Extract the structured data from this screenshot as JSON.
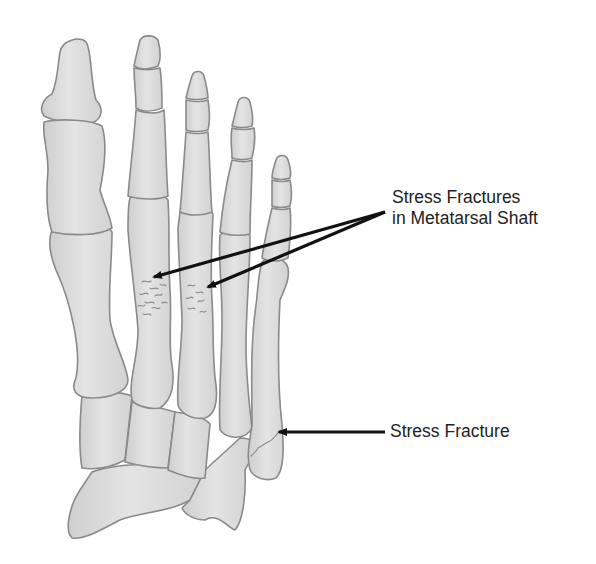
{
  "figure": {
    "colors": {
      "bone_fill": "#dcdcdc",
      "bone_outline": "#8a8a8a",
      "arrow": "#111111",
      "text": "#222222",
      "background": "#ffffff"
    }
  },
  "labels": {
    "metatarsal_label_line1": "Stress Fractures",
    "metatarsal_label_line2": "in Metatarsal Shaft",
    "fifth_metatarsal_label": "Stress Fracture"
  }
}
